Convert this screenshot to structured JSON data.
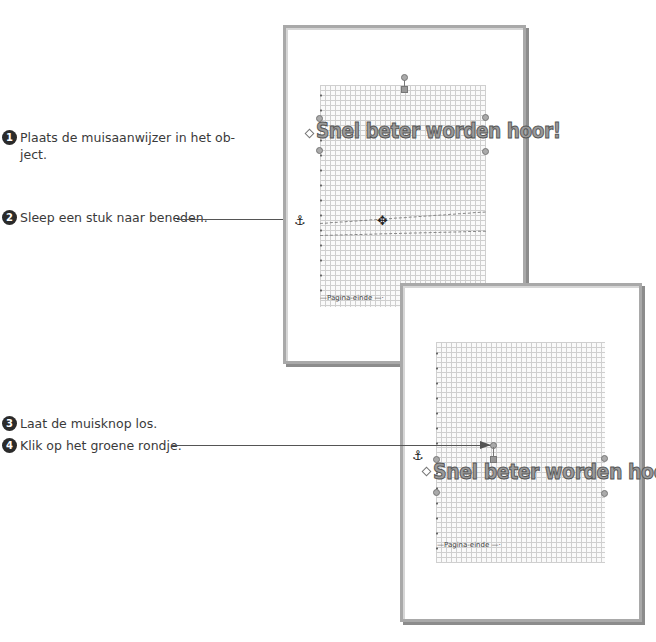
{
  "steps": [
    {
      "number": "1",
      "text": "Plaats de muisaanwijzer in het object.",
      "line1": "Plaats de muisaanwijzer in het ob-",
      "line2": "ject."
    },
    {
      "number": "2",
      "text": "Sleep een stuk naar beneden."
    },
    {
      "number": "3",
      "text": "Laat de muisknop los."
    },
    {
      "number": "4",
      "text": "Klik op het groene rondje."
    }
  ],
  "screenshot_before": {
    "wordart_text": "Snel beter worden hoor!",
    "page_break_label": "Pagina-einde",
    "anchor_icon": "⚓",
    "move_cursor_icon": "✥"
  },
  "screenshot_after": {
    "wordart_text": "Snel beter worden hoor!",
    "page_break_label": "Pagina-einde",
    "anchor_icon": "⚓"
  },
  "colors": {
    "step_badge": "#2b2b2b",
    "frame_border": "#a9a9a9",
    "grid_line": "#cfcfcf",
    "leader_line": "#555555"
  }
}
